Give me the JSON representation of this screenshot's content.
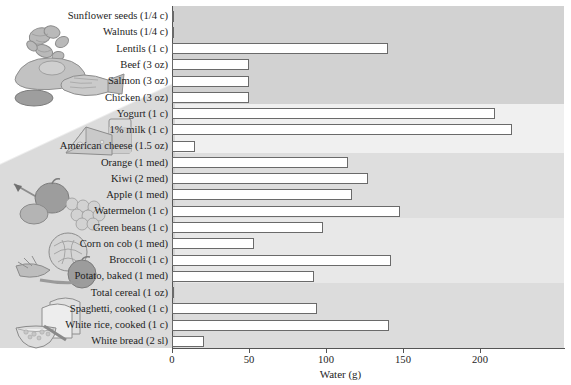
{
  "chart_data": {
    "type": "bar",
    "orientation": "horizontal",
    "title": "",
    "xlabel": "Water (g)",
    "ylabel": "",
    "xlim": [
      0,
      245
    ],
    "xticks": [
      0,
      50,
      100,
      150,
      200
    ],
    "xticklabels": [
      "0",
      "50",
      "100",
      "150",
      "200"
    ],
    "grid": false,
    "legend": null,
    "categories": [
      "Sunflower seeds (1/4 c)",
      "Walnuts (1/4 c)",
      "Lentils (1 c)",
      "Beef (3 oz)",
      "Salmon (3 oz)",
      "Chicken (3 oz)",
      "Yogurt (1 c)",
      "1% milk (1 c)",
      "American cheese (1.5 oz)",
      "Orange (1 med)",
      "Kiwi (2 med)",
      "Apple (1 med)",
      "Watermelon (1 c)",
      "Green beans (1 c)",
      "Corn on cob (1 med)",
      "Broccoli (1 c)",
      "Potato, baked (1 med)",
      "Total cereal (1 oz)",
      "Spaghetti, cooked (1 c)",
      "White rice, cooked (1 c)",
      "White bread (2 sl)"
    ],
    "values": [
      0,
      1,
      140,
      50,
      50,
      50,
      210,
      221,
      15,
      114,
      127,
      117,
      148,
      98,
      53,
      142,
      92,
      1,
      94,
      141,
      21
    ],
    "groups": [
      {
        "name": "protein-foods-nuts-legumes",
        "start": 0,
        "count": 6,
        "shade": "#d2d2d2"
      },
      {
        "name": "dairy",
        "start": 6,
        "count": 3,
        "shade": "#f0f0f0"
      },
      {
        "name": "fruits",
        "start": 9,
        "count": 4,
        "shade": "#dedede"
      },
      {
        "name": "vegetables",
        "start": 13,
        "count": 4,
        "shade": "#e8e8e8"
      },
      {
        "name": "grains",
        "start": 17,
        "count": 4,
        "shade": "#dcdcdc"
      }
    ]
  },
  "illustrations": [
    {
      "name": "nuts-illustration"
    },
    {
      "name": "meat-fish-poultry-illustration"
    },
    {
      "name": "cheese-milk-illustration"
    },
    {
      "name": "fruit-illustration"
    },
    {
      "name": "vegetables-illustration"
    },
    {
      "name": "bread-cereal-illustration"
    }
  ],
  "colors": {
    "bar_fill": "#ffffff",
    "bar_stroke": "#6a6a6a",
    "axis": "#555555",
    "text": "#1d1d1d",
    "wedge": "#c9c9c9"
  }
}
